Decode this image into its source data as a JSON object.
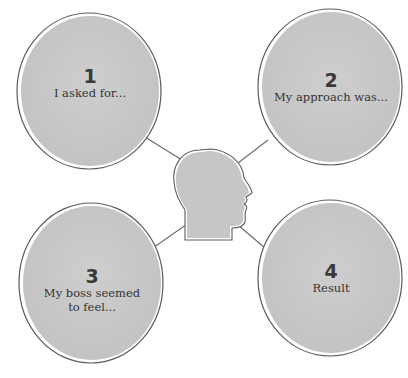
{
  "diagram": {
    "center_icon": "head-profile-icon",
    "bubbles": [
      {
        "number": "1",
        "text": "I asked for..."
      },
      {
        "number": "2",
        "text": "My approach was..."
      },
      {
        "number": "3",
        "text": "My boss seemed to feel..."
      },
      {
        "number": "4",
        "text": "Result"
      }
    ],
    "colors": {
      "bubble_fill": "#c9c9c9",
      "outline": "#555555",
      "connector": "#666666",
      "background": "#ffffff"
    }
  }
}
